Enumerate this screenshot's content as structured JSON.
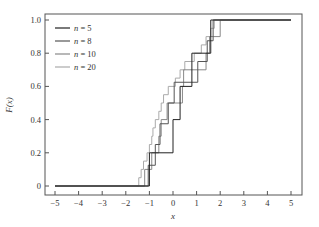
{
  "chart_data": {
    "type": "line",
    "subtype": "empirical-cdf-step",
    "title": "",
    "xlabel": "x",
    "ylabel": "F(x)",
    "xlim": [
      -5.5,
      5.5
    ],
    "ylim": [
      -0.05,
      1.05
    ],
    "xticks": [
      -5,
      -4,
      -3,
      -2,
      -1,
      0,
      1,
      2,
      3,
      4,
      5
    ],
    "xtick_labels": [
      "−5",
      "−4",
      "−3",
      "−2",
      "−1",
      "0",
      "1",
      "2",
      "3",
      "4",
      "5"
    ],
    "yticks": [
      0,
      0.2,
      0.4,
      0.6,
      0.8,
      1.0
    ],
    "ytick_labels": [
      "0",
      "0.2",
      "0.4",
      "0.6",
      "0.8",
      "1.0"
    ],
    "grid": false,
    "legend_position": "top-left",
    "x_start": -5,
    "x_end": 5,
    "series": [
      {
        "name": "n = 5",
        "n_label": "n",
        "eq_label": " = 5",
        "color": "#222222",
        "jumps": [
          -1.0,
          0.0,
          0.3,
          0.8,
          1.6
        ]
      },
      {
        "name": "n = 8",
        "n_label": "n",
        "eq_label": " = 8",
        "color": "#555555",
        "jumps": [
          -1.05,
          -0.75,
          -0.55,
          -0.2,
          0.05,
          1.05,
          1.45,
          1.7
        ]
      },
      {
        "name": "n = 10",
        "n_label": "n",
        "eq_label": " = 10",
        "color": "#888888",
        "jumps": [
          -1.2,
          -0.9,
          -0.6,
          -0.5,
          -0.25,
          0.4,
          0.45,
          1.4,
          1.55,
          2.0
        ]
      },
      {
        "name": "n = 20",
        "n_label": "n",
        "eq_label": " = 20",
        "color": "#aaaaaa",
        "jumps": [
          -1.45,
          -1.35,
          -1.25,
          -1.1,
          -1.0,
          -0.9,
          -0.85,
          -0.75,
          -0.6,
          -0.5,
          -0.4,
          -0.2,
          0.1,
          0.3,
          0.5,
          0.9,
          1.2,
          1.4,
          1.6,
          1.75
        ]
      }
    ]
  }
}
